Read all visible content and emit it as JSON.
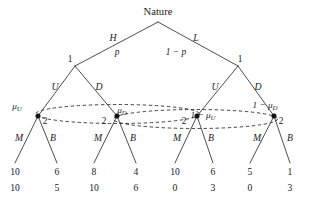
{
  "figure": {
    "type": "extensive-form-game-tree",
    "width": 315,
    "height": 205,
    "background_color": "#ffffff",
    "line_color": "#3a3a3a",
    "text_color": "#1a1a1a"
  },
  "root": {
    "label": "Nature",
    "x": 158,
    "y": 22
  },
  "nature_branches": [
    {
      "action": "H",
      "probability": "p",
      "action_x": 113,
      "action_y": 41,
      "prob_x": 117,
      "prob_y": 55
    },
    {
      "action": "L",
      "probability": "1 − p",
      "action_x": 196,
      "action_y": 41,
      "prob_x": 176,
      "prob_y": 55
    }
  ],
  "player1_nodes": [
    {
      "id": "p1-left",
      "player": "1",
      "x": 75,
      "y": 66,
      "label_x": 70,
      "label_y": 62
    },
    {
      "id": "p1-right",
      "player": "1",
      "x": 238,
      "y": 66,
      "label_x": 240,
      "label_y": 62
    }
  ],
  "player1_branches": [
    {
      "action": "U",
      "x": 55,
      "y": 90,
      "from": "p1-left",
      "to": "n1"
    },
    {
      "action": "D",
      "x": 99,
      "y": 90,
      "from": "p1-left",
      "to": "n2"
    },
    {
      "action": "U",
      "x": 215,
      "y": 90,
      "from": "p1-right",
      "to": "n3"
    },
    {
      "action": "D",
      "x": 258,
      "y": 90,
      "from": "p1-right",
      "to": "n4"
    }
  ],
  "player2_nodes": [
    {
      "id": "n1",
      "player": "2",
      "x": 38,
      "y": 116,
      "player_label_x": 45,
      "player_label_y": 124,
      "belief": "μ",
      "belief_sub": "U",
      "belief_prefix": "",
      "belief_x": 17,
      "belief_y": 109
    },
    {
      "id": "n2",
      "player": "2",
      "x": 117,
      "y": 116,
      "player_label_x": 104,
      "player_label_y": 124,
      "belief": "μ",
      "belief_sub": "D",
      "belief_prefix": "",
      "belief_x": 122,
      "belief_y": 113
    },
    {
      "id": "n3",
      "player": "2",
      "x": 197,
      "y": 116,
      "player_label_x": 184,
      "player_label_y": 124,
      "belief": "μ",
      "belief_sub": "U",
      "belief_prefix": "1 − ",
      "belief_x": 203,
      "belief_y": 118
    },
    {
      "id": "n4",
      "player": "2",
      "x": 274,
      "y": 116,
      "player_label_x": 281,
      "player_label_y": 124,
      "belief": "μ",
      "belief_sub": "D",
      "belief_prefix": "1 − ",
      "belief_x": 265,
      "belief_y": 108
    }
  ],
  "information_sets": [
    {
      "id": "infoset-U",
      "belongs_to_player": "2",
      "members": [
        "n1",
        "n3"
      ],
      "cx": 117.5,
      "cy": 114,
      "rx": 82,
      "ry": 9.5
    },
    {
      "id": "infoset-D",
      "belongs_to_player": "2",
      "members": [
        "n2",
        "n4"
      ],
      "cx": 195.5,
      "cy": 119,
      "rx": 82,
      "ry": 9.5
    }
  ],
  "player2_branches": [
    {
      "action": "M",
      "x": 19,
      "y": 141,
      "from": "n1",
      "leaf": 0
    },
    {
      "action": "B",
      "x": 53,
      "y": 141,
      "from": "n1",
      "leaf": 1
    },
    {
      "action": "M",
      "x": 98,
      "y": 141,
      "from": "n2",
      "leaf": 2
    },
    {
      "action": "B",
      "x": 133,
      "y": 141,
      "from": "n2",
      "leaf": 3
    },
    {
      "action": "M",
      "x": 177,
      "y": 141,
      "from": "n3",
      "leaf": 4
    },
    {
      "action": "B",
      "x": 211,
      "y": 141,
      "from": "n3",
      "leaf": 5
    },
    {
      "action": "M",
      "x": 257,
      "y": 141,
      "from": "n4",
      "leaf": 6
    },
    {
      "action": "B",
      "x": 290,
      "y": 141,
      "from": "n4",
      "leaf": 7
    }
  ],
  "terminal_nodes": [
    {
      "path": "H-U-M",
      "x": 15,
      "tip_y": 163,
      "payoff1": "10",
      "payoff2": "10"
    },
    {
      "path": "H-U-B",
      "x": 57,
      "tip_y": 163,
      "payoff1": "6",
      "payoff2": "5"
    },
    {
      "path": "H-D-M",
      "x": 94,
      "tip_y": 163,
      "payoff1": "8",
      "payoff2": "10"
    },
    {
      "path": "H-D-B",
      "x": 136,
      "tip_y": 163,
      "payoff1": "4",
      "payoff2": "6"
    },
    {
      "path": "L-U-M",
      "x": 175,
      "tip_y": 163,
      "payoff1": "10",
      "payoff2": "0"
    },
    {
      "path": "L-U-B",
      "x": 213,
      "tip_y": 163,
      "payoff1": "6",
      "payoff2": "3"
    },
    {
      "path": "L-D-M",
      "x": 250,
      "tip_y": 163,
      "payoff1": "5",
      "payoff2": "0"
    },
    {
      "path": "L-D-B",
      "x": 290,
      "tip_y": 163,
      "payoff1": "1",
      "payoff2": "3"
    }
  ],
  "payoff_rows": {
    "row1_y": 175,
    "row2_y": 191
  }
}
